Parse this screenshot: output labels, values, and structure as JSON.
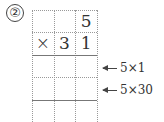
{
  "problem_label": "②",
  "grid": {
    "rows": [
      [
        "",
        "",
        "5"
      ],
      [
        "×",
        "3",
        "1"
      ],
      [
        "",
        "",
        ""
      ],
      [
        "",
        "",
        ""
      ],
      [
        "",
        "",
        ""
      ]
    ]
  },
  "annotations": [
    {
      "text": "5×1",
      "row": 3
    },
    {
      "text": "5×30",
      "row": 4
    }
  ]
}
